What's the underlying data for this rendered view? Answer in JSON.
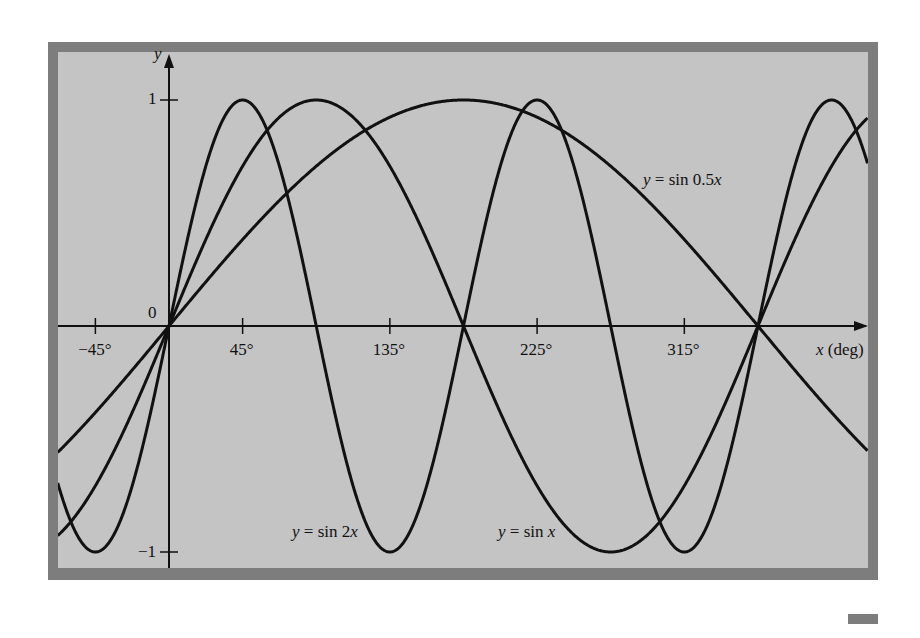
{
  "chart_data": {
    "type": "line",
    "title": "",
    "xlabel": "x (deg)",
    "ylabel": "y",
    "xlim": [
      -68,
      427
    ],
    "ylim": [
      -1.05,
      1.1
    ],
    "grid": false,
    "legend": "inline labels",
    "x_ticks": [
      {
        "value": -45,
        "label": "−45°"
      },
      {
        "value": 45,
        "label": "45°"
      },
      {
        "value": 135,
        "label": "135°"
      },
      {
        "value": 225,
        "label": "225°"
      },
      {
        "value": 315,
        "label": "315°"
      }
    ],
    "y_ticks": [
      {
        "value": 1,
        "label": "1"
      },
      {
        "value": -1,
        "label": "−1"
      }
    ],
    "origin_label": "0",
    "series": [
      {
        "name": "y = sin 2x",
        "function": "sin(2x)",
        "freq": 2
      },
      {
        "name": "y = sin x",
        "function": "sin(x)",
        "freq": 1
      },
      {
        "name": "y = sin 0.5x",
        "function": "sin(0.5x)",
        "freq": 0.5
      }
    ],
    "annotations": [
      {
        "text_prefix": "y = sin 0.5",
        "text_var": "x",
        "x_px": 643,
        "y_px": 182
      },
      {
        "text_prefix": "y = sin 2",
        "text_var": "x",
        "x_px": 292,
        "y_px": 534
      },
      {
        "text_prefix": "y = sin ",
        "text_var": "x",
        "x_px": 498,
        "y_px": 534
      }
    ]
  },
  "axis": {
    "y_label": "y",
    "x_label_var": "x",
    "x_label_unit": " (deg)"
  },
  "colors": {
    "frame": "#7d7d7d",
    "plot_bg": "#c4c4c4",
    "curve": "#111111"
  }
}
